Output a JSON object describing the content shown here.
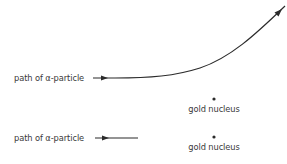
{
  "diagram": {
    "top_scenario": {
      "path_label": "path of α-particle",
      "nucleus_label": "gold nucleus"
    },
    "bottom_scenario": {
      "path_label": "path of α-particle",
      "nucleus_label": "gold nucleus"
    },
    "colors": {
      "line": "#2b2b2b",
      "text": "#3a3a3a",
      "background": "#ffffff"
    }
  }
}
